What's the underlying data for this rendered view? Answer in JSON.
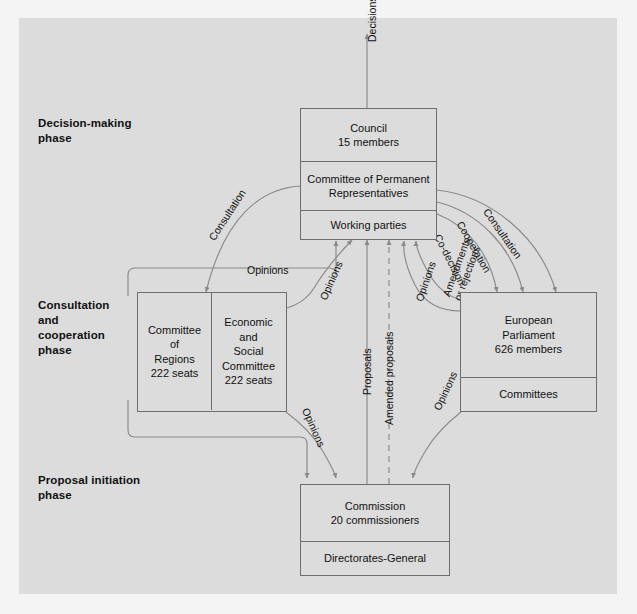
{
  "figure": {
    "background_color": "#dcdcdc",
    "line_color": "#6e6e6e",
    "text_color": "#111111"
  },
  "phases": [
    {
      "id": "decision-making",
      "label": "Decision-making\nphase",
      "line1": "Decision-making",
      "line2": "phase"
    },
    {
      "id": "consultation-cooperation",
      "label": "Consultation and cooperation phase",
      "line1": "Consultation",
      "line2": "and",
      "line3": "cooperation",
      "line4": "phase"
    },
    {
      "id": "proposal-initiation",
      "label": "Proposal initiation phase",
      "line1": "Proposal initiation",
      "line2": "phase"
    }
  ],
  "nodes": {
    "council": {
      "name": "Council",
      "sections": [
        {
          "id": "council-main",
          "lines": [
            "Council",
            "15 members"
          ]
        },
        {
          "id": "coreper",
          "lines": [
            "Committee of Permanent",
            "Representatives"
          ]
        },
        {
          "id": "working-parties",
          "lines": [
            "Working parties"
          ]
        }
      ],
      "tick_count": 9
    },
    "committee_of_regions": {
      "name": "Committee of Regions",
      "lines": [
        "Committee",
        "of",
        "Regions",
        "222 seats"
      ]
    },
    "economic_social_committee": {
      "name": "Economic and Social Committee",
      "lines": [
        "Economic",
        "and",
        "Social",
        "Committee",
        "222 seats"
      ]
    },
    "european_parliament": {
      "name": "European Parliament",
      "sections": [
        {
          "id": "ep-main",
          "lines": [
            "European",
            "Parliament",
            "626 members"
          ]
        },
        {
          "id": "ep-committees",
          "lines": [
            "Committees"
          ]
        }
      ],
      "tick_count": 9
    },
    "commission": {
      "name": "Commission",
      "sections": [
        {
          "id": "commission-main",
          "lines": [
            "Commission",
            "20 commissioners"
          ]
        },
        {
          "id": "directorates-general",
          "lines": [
            "Directorates-General"
          ]
        }
      ],
      "tick_count": 10
    }
  },
  "flows": [
    {
      "id": "decisions",
      "label": "Decisions",
      "from": "council",
      "to": "output",
      "orientation": "vertical-up"
    },
    {
      "id": "consultation-left",
      "label": "Consultation",
      "from": "council",
      "to": "committee_of_regions"
    },
    {
      "id": "opinions-left-horizontal",
      "label": "Opinions",
      "from": "committees",
      "to": "council"
    },
    {
      "id": "opinions-left-curve",
      "label": "Opinions",
      "from": "economic_social_committee",
      "to": "council"
    },
    {
      "id": "proposals",
      "label": "Proposals",
      "from": "commission",
      "to": "council"
    },
    {
      "id": "amended-proposals",
      "label": "Amended proposals",
      "from": "commission",
      "to": "council"
    },
    {
      "id": "opinions-right-curve",
      "label": "Opinions",
      "from": "european_parliament",
      "to": "council"
    },
    {
      "id": "amendments-or-rejections",
      "label": "Amendments\nor rejections",
      "line1": "Amendments",
      "line2": "or rejections",
      "from": "european_parliament",
      "to": "council"
    },
    {
      "id": "consultation-right",
      "label": "Consultation",
      "from": "council",
      "to": "european_parliament"
    },
    {
      "id": "cooperation",
      "label": "Cooperation",
      "from": "council",
      "to": "european_parliament"
    },
    {
      "id": "co-decision",
      "label": "Co-decision",
      "from": "council",
      "to": "european_parliament"
    },
    {
      "id": "opinions-bottom-left",
      "label": "Opinions",
      "from": "commission",
      "to": "committee_of_regions"
    },
    {
      "id": "opinions-bottom-right",
      "label": "Opinions",
      "from": "commission",
      "to": "european_parliament"
    }
  ]
}
